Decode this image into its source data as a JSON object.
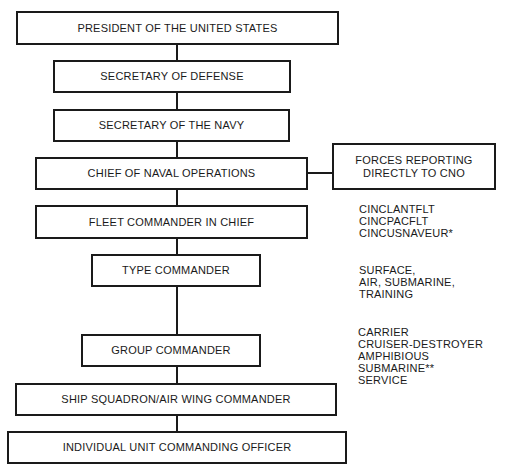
{
  "diagram": {
    "type": "organization-chart",
    "boxes": [
      {
        "id": "president",
        "label": "PRESIDENT OF THE UNITED STATES"
      },
      {
        "id": "secdef",
        "label": "SECRETARY OF DEFENSE"
      },
      {
        "id": "secnav",
        "label": "SECRETARY OF THE NAVY"
      },
      {
        "id": "cno",
        "label": "CHIEF OF NAVAL OPERATIONS"
      },
      {
        "id": "forces",
        "label_lines": [
          "FORCES REPORTING",
          "DIRECTLY TO CNO"
        ]
      },
      {
        "id": "fleet",
        "label": "FLEET COMMANDER IN CHIEF"
      },
      {
        "id": "type",
        "label": "TYPE COMMANDER"
      },
      {
        "id": "group",
        "label": "GROUP COMMANDER"
      },
      {
        "id": "squadron",
        "label": "SHIP SQUADRON/AIR WING COMMANDER"
      },
      {
        "id": "individual",
        "label": "INDIVIDUAL UNIT COMMANDING OFFICER"
      }
    ],
    "notes": {
      "fleet": [
        "CINCLANTFLT",
        "CINCPACFLT",
        "CINCUSNAVEUR*"
      ],
      "type": [
        "SURFACE,",
        "AIR, SUBMARINE,",
        "TRAINING"
      ],
      "group": [
        "CARRIER",
        "CRUISER-DESTROYER",
        "AMPHIBIOUS",
        "SUBMARINE**",
        "SERVICE"
      ]
    },
    "edges": [
      [
        "president",
        "secdef"
      ],
      [
        "secdef",
        "secnav"
      ],
      [
        "secnav",
        "cno"
      ],
      [
        "cno",
        "forces"
      ],
      [
        "cno",
        "fleet"
      ],
      [
        "fleet",
        "type"
      ],
      [
        "type",
        "group"
      ],
      [
        "group",
        "squadron"
      ],
      [
        "squadron",
        "individual"
      ]
    ]
  }
}
